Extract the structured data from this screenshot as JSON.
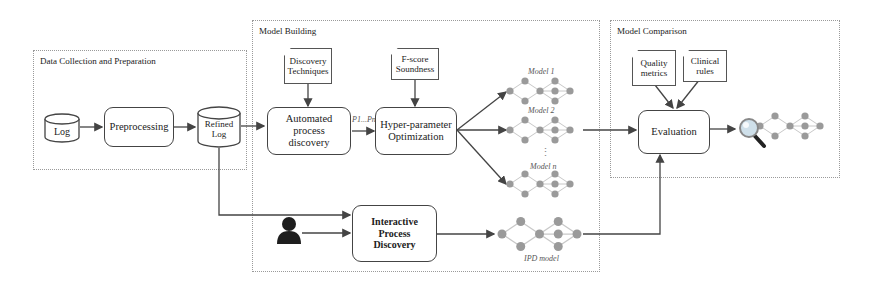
{
  "groups": {
    "data_collection": {
      "title": "Data Collection and Preparation"
    },
    "model_building": {
      "title": "Model Building"
    },
    "model_comparison": {
      "title": "Model Comparison"
    }
  },
  "nodes": {
    "log": "Log",
    "preprocessing": "Preprocessing",
    "refined_log": "Refined Log",
    "discovery_techniques": "Discovery Techniques",
    "automated_process_discovery": "Automated process discovery",
    "fscore_soundness": "F-score Soundness",
    "hyper_parameter_optimization": "Hyper-parameter Optimization",
    "interactive_process_discovery": "Interactive Process Discovery",
    "quality_metrics": "Quality metrics",
    "clinical_rules": "Clinical rules",
    "evaluation": "Evaluation"
  },
  "edge_labels": {
    "params": "P1...Pn"
  },
  "models": {
    "model1": "Model 1",
    "model2": "Model 2",
    "modeln": "Model n",
    "ipd_model": "IPD model",
    "dots": "⋮"
  },
  "icons": {
    "user": "user-icon",
    "inspect": "magnifier-model-icon"
  },
  "colors": {
    "node_fill": "#9a9a9a",
    "edge_stroke": "#c8c8c8",
    "arrow": "#444444",
    "group_border": "#9a9a9a"
  }
}
